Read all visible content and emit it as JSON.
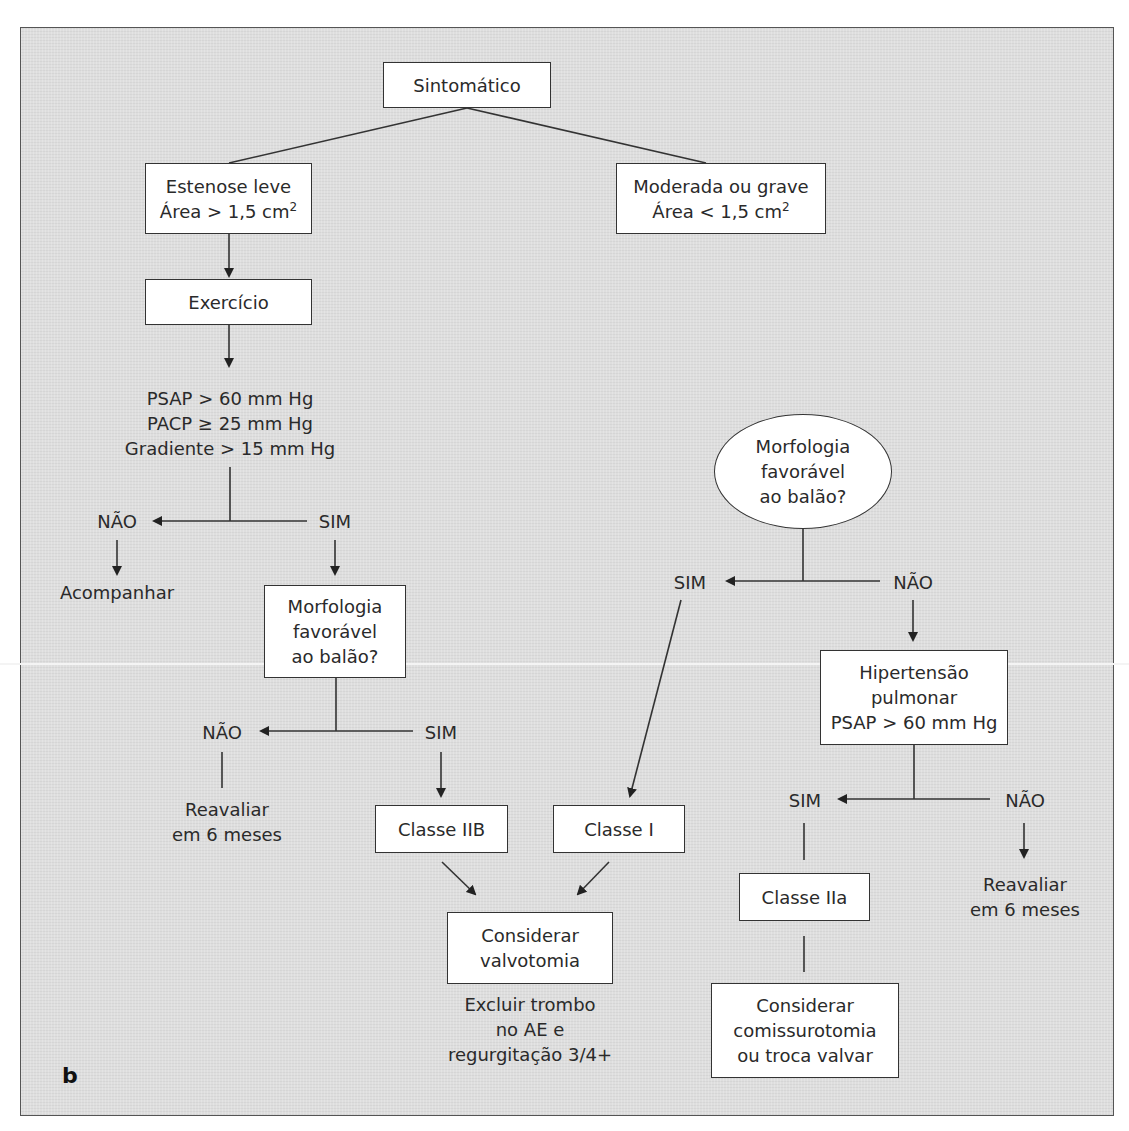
{
  "diagram": {
    "panel_letter": "b",
    "nodes": {
      "sintomatico": "Sintomático",
      "estenose_leve": {
        "line1": "Estenose leve",
        "line2": "Área > 1,5 cm",
        "sup": "2"
      },
      "moderada_grave": {
        "line1": "Moderada ou grave",
        "line2": "Área < 1,5 cm",
        "sup": "2"
      },
      "exercicio": "Exercício",
      "criteria": [
        "PSAP > 60 mm Hg",
        "PACP ≥ 25 mm Hg",
        "Gradiente > 15 mm Hg"
      ],
      "morfologia_left": [
        "Morfologia",
        "favorável",
        "ao balão?"
      ],
      "morfologia_right": [
        "Morfologia",
        "favorável",
        "ao balão?"
      ],
      "acompanhar": "Acompanhar",
      "reavaliar_left": [
        "Reavaliar",
        "em 6 meses"
      ],
      "hipertensao": [
        "Hipertensão",
        "pulmonar",
        "PSAP > 60 mm Hg"
      ],
      "classe_iib": "Classe IIB",
      "classe_i": "Classe I",
      "classe_iia": "Classe IIa",
      "considerar_valvotomia": [
        "Considerar",
        "valvotomia"
      ],
      "excluir_note": [
        "Excluir trombo",
        "no AE e",
        "regurgitação 3/4+"
      ],
      "reavaliar_right": [
        "Reavaliar",
        "em 6 meses"
      ],
      "considerar_comissurotomia": [
        "Considerar",
        "comissurotomia",
        "ou troca valvar"
      ]
    },
    "branch_labels": {
      "criteria_no": "NÃO",
      "criteria_yes": "SIM",
      "morf_left_no": "NÃO",
      "morf_left_yes": "SIM",
      "morf_right_yes": "SIM",
      "morf_right_no": "NÃO",
      "hipert_yes": "SIM",
      "hipert_no": "NÃO"
    },
    "colors": {
      "background": "#dedede",
      "box_fill": "#ffffff",
      "stroke": "#333333",
      "text": "#2a2a2a"
    }
  }
}
